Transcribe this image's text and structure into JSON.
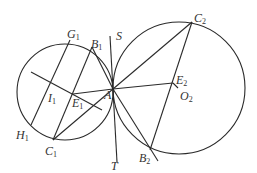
{
  "figure": {
    "labels": {
      "G1": {
        "base": "G",
        "sub": "1"
      },
      "B1": {
        "base": "B",
        "sub": "1"
      },
      "S": {
        "base": "S",
        "sub": ""
      },
      "C2": {
        "base": "C",
        "sub": "2"
      },
      "I1": {
        "base": "I",
        "sub": "1"
      },
      "E1": {
        "base": "E",
        "sub": "1"
      },
      "A": {
        "base": "A",
        "sub": ""
      },
      "E2": {
        "base": "E",
        "sub": "2"
      },
      "O2": {
        "base": "O",
        "sub": "2"
      },
      "H1": {
        "base": "H",
        "sub": "1"
      },
      "C1": {
        "base": "C",
        "sub": "1"
      },
      "T": {
        "base": "T",
        "sub": ""
      },
      "B2": {
        "base": "B",
        "sub": "2"
      }
    }
  }
}
